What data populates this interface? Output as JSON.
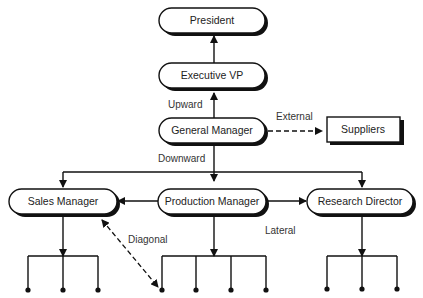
{
  "diagram": {
    "type": "organizational-communication-flow",
    "nodes": {
      "president": "President",
      "executive_vp": "Executive VP",
      "general_manager": "General Manager",
      "suppliers": "Suppliers",
      "sales_manager": "Sales Manager",
      "production_manager": "Production Manager",
      "research_director": "Research Director"
    },
    "edge_labels": {
      "upward": "Upward",
      "external": "External",
      "downward": "Downward",
      "diagonal": "Diagonal",
      "lateral": "Lateral"
    },
    "edges": [
      {
        "from": "Executive VP",
        "to": "President",
        "style": "solid",
        "label": ""
      },
      {
        "from": "General Manager",
        "to": "Executive VP",
        "style": "solid",
        "label": "Upward"
      },
      {
        "from": "General Manager",
        "to": "Suppliers",
        "style": "dashed",
        "label": "External"
      },
      {
        "from": "General Manager",
        "to": "Sales Manager",
        "style": "solid",
        "label": "Downward"
      },
      {
        "from": "General Manager",
        "to": "Production Manager",
        "style": "solid",
        "label": "Downward"
      },
      {
        "from": "General Manager",
        "to": "Research Director",
        "style": "solid",
        "label": "Downward"
      },
      {
        "from": "Production Manager",
        "to": "Sales Manager",
        "style": "solid",
        "label": "Lateral"
      },
      {
        "from": "Production Manager",
        "to": "Research Director",
        "style": "solid",
        "label": "Lateral"
      },
      {
        "from": "Sales Manager",
        "to": "Production subordinate",
        "style": "dashed-bidirectional",
        "label": "Diagonal"
      }
    ],
    "subordinates": {
      "sales_manager": 3,
      "production_manager": 4,
      "research_director": 3
    },
    "colors": {
      "stroke": "#111111",
      "background": "#ffffff",
      "text": "#222222"
    }
  }
}
